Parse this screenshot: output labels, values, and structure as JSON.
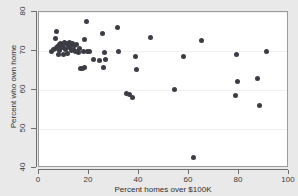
{
  "chart_data": {
    "type": "scatter",
    "title": "",
    "xlabel": "Percent homes over $100K",
    "ylabel": "Percent who own home",
    "xlim": [
      0,
      100
    ],
    "ylim": [
      40,
      80
    ],
    "xticks": [
      0,
      20,
      40,
      60,
      80,
      100
    ],
    "yticks": [
      40,
      50,
      60,
      70,
      80
    ],
    "grid": "horizontal",
    "legend": null,
    "marker_color": "#3c3c44",
    "panel_color": "#ffffff",
    "figure_color": "#e9e9e9",
    "series": [
      {
        "name": "states",
        "points": [
          [
            4.8,
            69.9
          ],
          [
            5.6,
            70.3
          ],
          [
            6.4,
            73.1
          ],
          [
            6.7,
            70.6
          ],
          [
            7.1,
            75.0
          ],
          [
            7.3,
            71.2
          ],
          [
            7.6,
            69.2
          ],
          [
            8.0,
            71.6
          ],
          [
            8.3,
            70.2
          ],
          [
            8.6,
            72.0
          ],
          [
            9.0,
            70.8
          ],
          [
            9.3,
            71.4
          ],
          [
            9.6,
            69.0
          ],
          [
            9.9,
            71.0
          ],
          [
            10.3,
            72.2
          ],
          [
            10.6,
            70.5
          ],
          [
            11.0,
            71.8
          ],
          [
            11.3,
            69.3
          ],
          [
            11.6,
            71.1
          ],
          [
            12.0,
            72.3
          ],
          [
            12.3,
            70.9
          ],
          [
            12.6,
            71.5
          ],
          [
            13.0,
            70.1
          ],
          [
            13.4,
            71.9
          ],
          [
            13.8,
            70.4
          ],
          [
            14.2,
            71.3
          ],
          [
            14.6,
            69.8
          ],
          [
            15.0,
            71.7
          ],
          [
            15.4,
            70.0
          ],
          [
            15.8,
            69.5
          ],
          [
            16.2,
            70.7
          ],
          [
            16.6,
            65.6
          ],
          [
            17.2,
            65.4
          ],
          [
            17.6,
            69.9
          ],
          [
            18.0,
            65.8
          ],
          [
            18.3,
            73.0
          ],
          [
            18.8,
            77.5
          ],
          [
            19.4,
            70.0
          ],
          [
            20.0,
            69.9
          ],
          [
            21.6,
            67.8
          ],
          [
            24.2,
            67.5
          ],
          [
            25.4,
            74.6
          ],
          [
            25.8,
            65.8
          ],
          [
            26.0,
            69.6
          ],
          [
            26.6,
            67.9
          ],
          [
            31.4,
            76.0
          ],
          [
            31.8,
            69.9
          ],
          [
            35.0,
            59.2
          ],
          [
            36.0,
            58.9
          ],
          [
            37.4,
            58.1
          ],
          [
            38.6,
            68.5
          ],
          [
            38.8,
            65.3
          ],
          [
            44.6,
            73.4
          ],
          [
            54.2,
            60.2
          ],
          [
            57.8,
            68.6
          ],
          [
            61.8,
            42.7
          ],
          [
            65.0,
            72.8
          ],
          [
            78.6,
            58.5
          ],
          [
            79.0,
            69.2
          ],
          [
            79.4,
            62.3
          ],
          [
            87.2,
            62.9
          ],
          [
            88.0,
            56.0
          ],
          [
            90.8,
            69.8
          ]
        ]
      }
    ]
  }
}
